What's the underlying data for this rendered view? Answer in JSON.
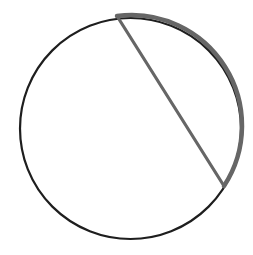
{
  "diagram": {
    "type": "circle-with-chord",
    "circle": {
      "cx": 130.5,
      "cy": 128.5,
      "r": 110.5,
      "stroke": "#1e1e1e",
      "stroke_width": 2.2
    },
    "chord": {
      "x1": 117,
      "y1": 16,
      "x2": 224,
      "y2": 186,
      "stroke": "#666666",
      "stroke_width": 3.2
    },
    "highlighted_arc": {
      "from": [
        117,
        16
      ],
      "to": [
        224,
        186
      ],
      "stroke": "#666666",
      "stroke_width": 4.5
    },
    "colors": {
      "background": "#ffffff",
      "circle": "#1e1e1e",
      "highlight": "#666666"
    }
  }
}
